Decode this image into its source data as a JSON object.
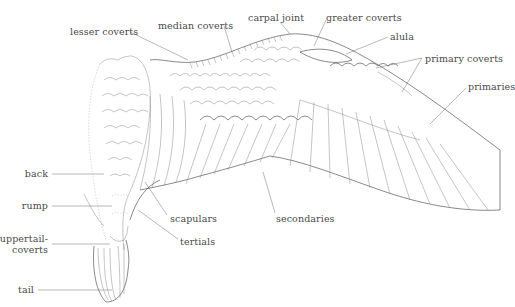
{
  "diagram": {
    "labels": {
      "lesser_coverts": "lesser coverts",
      "median_coverts": "median coverts",
      "carpal_joint": "carpal joint",
      "greater_coverts": "greater coverts",
      "alula": "alula",
      "primary_coverts": "primary coverts",
      "primaries": "primaries",
      "back": "back",
      "rump": "rump",
      "uppertail_coverts_line1": "uppertail-",
      "uppertail_coverts_line2": "coverts",
      "tail": "tail",
      "scapulars": "scapulars",
      "tertials": "tertials",
      "secondaries": "secondaries"
    },
    "colors": {
      "ink": "#3a3a3a",
      "label_text": "#4a4a4a",
      "leader_line": "#9a9a9a",
      "background": "#ffffff"
    }
  }
}
